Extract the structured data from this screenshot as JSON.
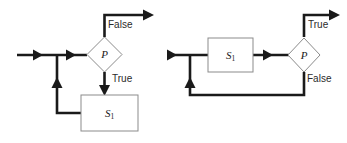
{
  "figure": {
    "background_color": "#ffffff",
    "line_color": "#1a1a1a",
    "shape_stroke_color": "#8b8b8b",
    "shape_fill_color": "#ffffff"
  },
  "diagrams": [
    {
      "id": "while-loop",
      "name": "while-loop-flowchart",
      "decision_label": "P",
      "process_label": "S",
      "process_subscript": "1",
      "branch_true_label": "True",
      "branch_false_label": "False"
    },
    {
      "id": "repeat-until-loop",
      "name": "repeat-until-flowchart",
      "decision_label": "P",
      "process_label": "S",
      "process_subscript": "1",
      "branch_true_label": "True",
      "branch_false_label": "False"
    }
  ]
}
